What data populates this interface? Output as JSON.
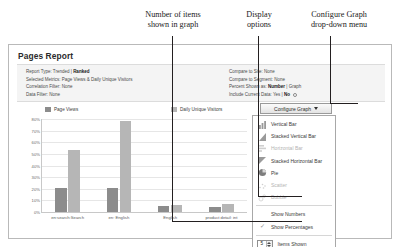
{
  "annotations": {
    "items_shown": "Number of items\nshown in graph",
    "display_options": "Display\noptions",
    "configure_menu": "Configure Graph\ndrop-down menu"
  },
  "window": {
    "title": "Pages Report"
  },
  "meta": {
    "left": [
      {
        "label": "Report Type:",
        "value": "Trended | ",
        "bold": "Ranked"
      },
      {
        "label": "Selected Metrics:",
        "value": "Page Views & Daily Unique Visitors",
        "bold": ""
      },
      {
        "label": "Correlation Filter:",
        "value": "None",
        "bold": ""
      },
      {
        "label": "Data Filter:",
        "value": "None",
        "bold": ""
      }
    ],
    "right": [
      {
        "label": "Compare to Site:",
        "value": "None",
        "bold": ""
      },
      {
        "label": "Compare to Segment:",
        "value": "None",
        "bold": ""
      },
      {
        "label": "Percent Shown as:",
        "value": " | Graph",
        "bold": "Number"
      },
      {
        "label": "Include Current Data:",
        "value": "Yes | ",
        "bold": "No"
      }
    ]
  },
  "toolbar": {
    "configure_graph_label": "Configure Graph",
    "caret_icon": "chevron-down-icon"
  },
  "menu": {
    "chart_types": [
      {
        "label": "Vertical Bar",
        "icon": "vertical-bar-icon",
        "disabled": false
      },
      {
        "label": "Stacked Vertical Bar",
        "icon": "stacked-vertical-bar-icon",
        "disabled": false
      },
      {
        "label": "Horizontal Bar",
        "icon": "horizontal-bar-icon",
        "disabled": true
      },
      {
        "label": "Stacked Horizontal Bar",
        "icon": "stacked-horizontal-bar-icon",
        "disabled": false
      },
      {
        "label": "Pie",
        "icon": "pie-icon",
        "disabled": false
      },
      {
        "label": "Scatter",
        "icon": "scatter-icon",
        "disabled": true
      },
      {
        "label": "Bubble",
        "icon": "bubble-icon",
        "disabled": true
      }
    ],
    "options": [
      {
        "label": "Show Numbers",
        "checked": false
      },
      {
        "label": "Show Percentages",
        "checked": true
      }
    ],
    "items_shown_label": "Items Shown",
    "items_shown_value": "5"
  },
  "chart_data": {
    "type": "bar",
    "title": "",
    "xlabel": "",
    "ylabel": "",
    "ylim": [
      0,
      80
    ],
    "grid": true,
    "legend_position": "top",
    "ytick_labels": [
      "80%",
      "70%",
      "60%",
      "50%",
      "40%",
      "30%",
      "20%",
      "10%",
      "0%"
    ],
    "ytick_values": [
      80,
      70,
      60,
      50,
      40,
      30,
      20,
      10,
      0
    ],
    "categories": [
      "en:search:Search",
      "en: English",
      "English",
      "product detail: int"
    ],
    "series": [
      {
        "name": "Page Views",
        "color": "#8c8c8c",
        "values": [
          21,
          21,
          5,
          4
        ]
      },
      {
        "name": "Daily Unique Visitors",
        "color": "#b6b6b6",
        "values": [
          53,
          78,
          6,
          7
        ]
      }
    ]
  }
}
